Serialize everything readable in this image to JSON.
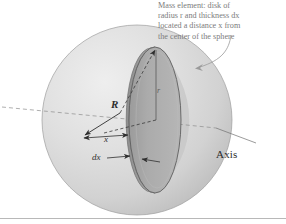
{
  "figure": {
    "title_caption": {
      "lines": [
        "Mass element: disk of",
        "radius r and thickness dx",
        "located a distance x from",
        "the center of the sphere"
      ],
      "full_text": "Mass element: disk of radius r and thickness dx located a distance x from the center of the sphere"
    },
    "labels": {
      "sphere_radius": "R",
      "disk_radius": "r",
      "distance_from_center": "x",
      "disk_thickness": "dx",
      "axis": "Axis"
    },
    "colors": {
      "sphere_fill_light": "#e2e2e2",
      "sphere_fill_mid": "#d2d2d2",
      "sphere_fill_dark": "#bdbdbd",
      "disk_face": "#adadad",
      "disk_rim": "#9a9a9a",
      "outline": "#6e6e6e",
      "caption_text": "#7c7c7c",
      "label_text": "#2e2e2e",
      "rule": "#b8b8b8",
      "background": "#ffffff"
    },
    "geometry": {
      "sphere_center_x": 137,
      "sphere_center_y": 120,
      "sphere_radius_px": 95,
      "disk_center_x": 155,
      "disk_center_y": 120,
      "disk_semi_major_y": 73,
      "disk_semi_minor_x": 26,
      "axis_label_position": "right"
    }
  }
}
